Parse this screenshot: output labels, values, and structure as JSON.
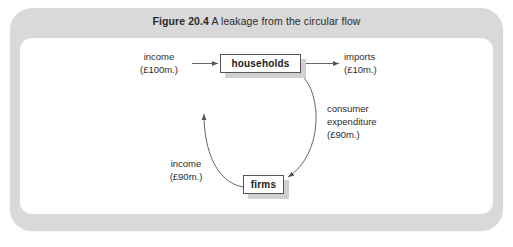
{
  "figure": {
    "number": "Figure 20.4",
    "title": "A leakage from the circular flow"
  },
  "colors": {
    "frame": "#d9d9d9",
    "panel": "#ffffff",
    "box_border": "#555555",
    "box_shadow": "#d0d0d0",
    "text": "#2b2b2b",
    "arrow": "#555555"
  },
  "diagram": {
    "type": "circular-flow",
    "nodes": [
      {
        "id": "households",
        "label": "households"
      },
      {
        "id": "firms",
        "label": "firms"
      }
    ],
    "flows": [
      {
        "id": "income-in",
        "name": "income",
        "amount": "(£100m.)",
        "from": "external",
        "to": "households",
        "shape": "straight-arrow",
        "direction": "right"
      },
      {
        "id": "imports",
        "name": "imports",
        "amount": "(£10m.)",
        "from": "households",
        "to": "external",
        "shape": "straight-arrow",
        "direction": "right"
      },
      {
        "id": "consumer-expenditure",
        "name_line1": "consumer",
        "name_line2": "expenditure",
        "amount": "(£90m.)",
        "from": "households",
        "to": "firms",
        "shape": "curved-arc",
        "direction": "clockwise-down-right"
      },
      {
        "id": "income-out",
        "name": "income",
        "amount": "(£90m.)",
        "from": "firms",
        "to": "households",
        "shape": "curved-arc",
        "direction": "clockwise-up-left"
      }
    ]
  }
}
